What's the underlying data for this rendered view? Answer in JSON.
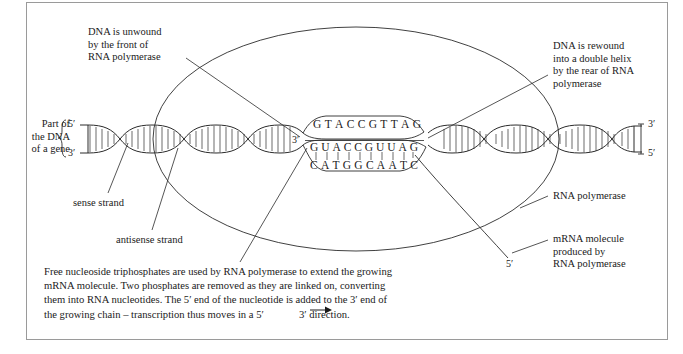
{
  "figure": {
    "frame_color": "#9a9a9a",
    "line_color": "#2b2b2b",
    "background": "#ffffff"
  },
  "left_bracket_label": "Part of\nthe DNA\nof a gene",
  "ends": {
    "left_top": "5′",
    "left_bottom": "3′",
    "right_top": "3′",
    "right_bottom": "5′",
    "bubble_left_template": "3′",
    "mrna_free_end": "5′"
  },
  "annotations": {
    "unwound": "DNA is unwound\nby the front of\nRNA polymerase",
    "rewound": "DNA is rewound\ninto a double helix\nby the rear of RNA\npolymerase",
    "sense_strand": "sense strand",
    "antisense_strand": "antisense strand",
    "rna_polymerase": "RNA polymerase",
    "mrna_molecule": "mRNA molecule\nproduced by\nRNA polymerase"
  },
  "sequences": {
    "sense_strand_top": "G T A C C G T T A G",
    "mrna_transcript": "G U A C C G U U A G",
    "antisense_template": "C A T G G C A A T C",
    "sense_letters": [
      "G",
      "T",
      "A",
      "C",
      "C",
      "G",
      "T",
      "T",
      "A",
      "G"
    ],
    "mrna_letters": [
      "G",
      "U",
      "A",
      "C",
      "C",
      "G",
      "U",
      "U",
      "A",
      "G"
    ],
    "template_letters": [
      "C",
      "A",
      "T",
      "G",
      "G",
      "C",
      "A",
      "A",
      "T",
      "C"
    ]
  },
  "caption": {
    "line1": "Free nucleoside triphosphates are used by RNA polymerase to extend the growing",
    "line2": "mRNA molecule. Two phosphates are removed as they are linked on, converting",
    "line3": "them into RNA nucleotides. The 5′ end of the nucleotide is added to the 3′ end of",
    "line4_a": "the growing chain – transcription thus moves in a 5′",
    "line4_b": "3′ direction."
  }
}
